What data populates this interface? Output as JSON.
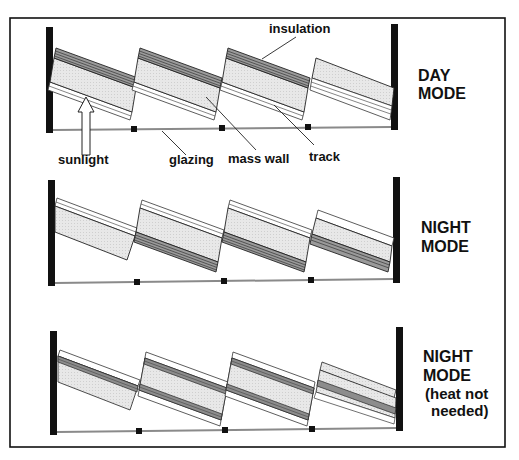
{
  "figure": {
    "frame_color": "#111111",
    "colors": {
      "mass_wall_fill": "#e6e6e6",
      "insulation_line": "#555555",
      "post": "#111111",
      "glazing": "#8a8a8a",
      "track": "#333333"
    }
  },
  "panels": [
    {
      "mode_line1": "DAY",
      "mode_line2": "MODE",
      "labels": {
        "insulation": "insulation",
        "sunlight": "sunlight",
        "glazing": "glazing",
        "mass_wall": "mass wall",
        "track": "track"
      }
    },
    {
      "mode_line1": "NIGHT",
      "mode_line2": "MODE"
    },
    {
      "mode_line1": "NIGHT",
      "mode_line2": "MODE",
      "mode_line3": "(heat not",
      "mode_line4": "needed)"
    }
  ]
}
